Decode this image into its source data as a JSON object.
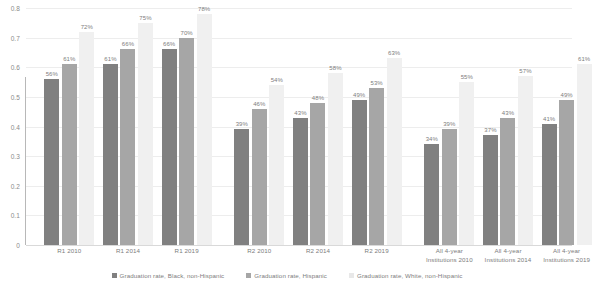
{
  "chart_data": {
    "type": "bar",
    "title": "",
    "subtitle": "",
    "xlabel": "",
    "ylabel": "",
    "ylim": [
      0,
      0.8
    ],
    "ytick_labels": [
      "0.8",
      "0.7",
      "0.6",
      "0.5",
      "0.4",
      "0.3",
      "0.2",
      "0.1",
      "0"
    ],
    "ytick_values": [
      0.8,
      0.7,
      0.6,
      0.5,
      0.4,
      0.3,
      0.2,
      0.1,
      0
    ],
    "grid": true,
    "legend_position": "bottom",
    "categories": [
      "R1 2010",
      "R1 2014",
      "R1 2019",
      "R2 2010",
      "R2 2014",
      "R2 2019",
      "All 4-year Institutions 2010",
      "All 4-year Institutions 2014",
      "All 4-year Institutions 2019"
    ],
    "category_lines": [
      [
        "R1 2010"
      ],
      [
        "R1 2014"
      ],
      [
        "R1 2019"
      ],
      [
        "R2 2010"
      ],
      [
        "R2 2014"
      ],
      [
        "R2 2019"
      ],
      [
        "All 4-year",
        "Institutions 2010"
      ],
      [
        "All 4-year",
        "Institutions 2014"
      ],
      [
        "All 4-year",
        "Institutions 2019"
      ]
    ],
    "series": [
      {
        "name": "Graduation rate, Black, non-Hispanic",
        "color": "#808080",
        "values": [
          0.56,
          0.61,
          0.66,
          0.39,
          0.43,
          0.49,
          0.34,
          0.37,
          0.41
        ],
        "labels": [
          "56%",
          "61%",
          "66%",
          "39%",
          "43%",
          "49%",
          "34%",
          "37%",
          "41%"
        ]
      },
      {
        "name": "Graduation rate, Hispanic",
        "color": "#a6a6a6",
        "values": [
          0.61,
          0.66,
          0.7,
          0.46,
          0.48,
          0.53,
          0.39,
          0.43,
          0.49
        ],
        "labels": [
          "61%",
          "66%",
          "70%",
          "46%",
          "48%",
          "53%",
          "39%",
          "43%",
          "49%"
        ]
      },
      {
        "name": "Graduation rate, White, non-Hispanic",
        "color": "#f0f0f0",
        "values": [
          0.72,
          0.75,
          0.78,
          0.54,
          0.58,
          0.63,
          0.55,
          0.57,
          0.61
        ],
        "labels": [
          "72%",
          "75%",
          "78%",
          "54%",
          "58%",
          "63%",
          "55%",
          "57%",
          "61%"
        ]
      }
    ]
  },
  "legend": {
    "items": [
      "Graduation rate, Black, non-Hispanic",
      "Graduation rate, Hispanic",
      "Graduation rate, White, non-Hispanic"
    ]
  }
}
